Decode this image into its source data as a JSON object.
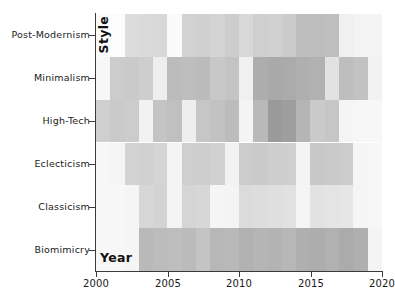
{
  "chart_data": {
    "type": "heatmap",
    "title": "",
    "xlabel": "Year",
    "ylabel": "Style",
    "grid": false,
    "legend": "none",
    "colormap": "Greys",
    "xlim": [
      2000,
      2020
    ],
    "x": [
      2000,
      2001,
      2002,
      2003,
      2004,
      2005,
      2006,
      2007,
      2008,
      2009,
      2010,
      2011,
      2012,
      2013,
      2014,
      2015,
      2016,
      2017,
      2018,
      2019
    ],
    "xticklabels": [
      "2000",
      "2005",
      "2010",
      "2015",
      "2020"
    ],
    "xtickvalues": [
      2000,
      2005,
      2010,
      2015,
      2020
    ],
    "categories": [
      "Post-Modernism",
      "Minimalism",
      "High-Tech",
      "Eclecticism",
      "Classicism",
      "Biomimicry"
    ],
    "yticklabels": [
      "Post-Modernism",
      "Minimalism",
      "High-Tech",
      "Eclecticism",
      "Classicism",
      "Biomimicry"
    ],
    "vmin": 0,
    "vmax": 100,
    "rows": [
      {
        "name": "Post-Modernism",
        "values": [
          4,
          3,
          22,
          24,
          26,
          5,
          30,
          32,
          28,
          34,
          26,
          33,
          31,
          36,
          46,
          47,
          45,
          12,
          10,
          9
        ],
        "colors": [
          "#fbfbfb",
          "#fcfcfc",
          "#dcdcdc",
          "#dadada",
          "#d8d8d8",
          "#fafafa",
          "#d2d2d2",
          "#d0d0d0",
          "#d4d4d4",
          "#cdcdcd",
          "#d8d8d8",
          "#cfcfcf",
          "#d1d1d1",
          "#cbcbcb",
          "#bebebe",
          "#bdbdbd",
          "#bfbfbf",
          "#f0f0f0",
          "#f3f3f3",
          "#f4f4f4"
        ]
      },
      {
        "name": "Minimalism",
        "values": [
          3,
          26,
          27,
          25,
          8,
          34,
          33,
          35,
          28,
          30,
          7,
          42,
          44,
          43,
          41,
          40,
          14,
          33,
          31,
          6
        ]
      },
      {
        "name": "High-Tech",
        "values": [
          24,
          27,
          26,
          6,
          30,
          32,
          8,
          29,
          31,
          34,
          5,
          36,
          52,
          50,
          38,
          27,
          29,
          4,
          3,
          3
        ]
      },
      {
        "name": "Eclecticism",
        "values": [
          3,
          4,
          22,
          23,
          21,
          5,
          24,
          25,
          23,
          6,
          26,
          27,
          25,
          24,
          5,
          28,
          27,
          26,
          4,
          3
        ]
      },
      {
        "name": "Classicism",
        "values": [
          3,
          3,
          4,
          20,
          22,
          5,
          21,
          20,
          4,
          5,
          18,
          17,
          16,
          15,
          4,
          14,
          13,
          12,
          4,
          3
        ]
      },
      {
        "name": "Biomimicry",
        "values": [
          3,
          3,
          4,
          36,
          34,
          33,
          35,
          30,
          37,
          36,
          40,
          38,
          39,
          37,
          41,
          42,
          40,
          43,
          41,
          5
        ]
      }
    ]
  },
  "axes": {
    "x_title": "Year",
    "y_title": "Style"
  }
}
